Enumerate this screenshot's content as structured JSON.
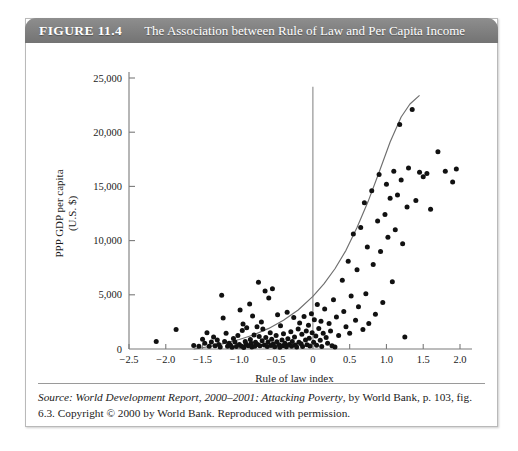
{
  "figure": {
    "number_label": "FIGURE 11.4",
    "caption": "The Association between Rule of Law and Per Capita Income",
    "source_prefix": "Source: ",
    "source_italic_1": "World Development Report, 2000–2001: Attacking Poverty",
    "source_rest": ", by World Bank, p. 103, fig. 6.3. Copyright © 2000 by World Bank. Reproduced with permission."
  },
  "colors": {
    "header_bar": "#7d7d7d",
    "header_text": "#ffffff",
    "axis": "#7a7a7a",
    "point": "#111111",
    "curve": "#6e6e6e",
    "reference_line": "#8a8a8a",
    "box_border": "#b9b9b9"
  },
  "chart_data": {
    "type": "scatter",
    "title": "The Association between Rule of Law and Per Capita Income",
    "xlabel": "Rule of law index",
    "ylabel": "PPP GDP per capita\n(U.S. $)",
    "ylabel_line1": "PPP GDP per capita",
    "ylabel_line2": "(U.S. $)",
    "xlim": [
      -2.5,
      2.0
    ],
    "ylim": [
      0,
      25000
    ],
    "xticks": [
      -2.5,
      -2.0,
      -1.5,
      -1.0,
      -0.5,
      0,
      0.5,
      1.0,
      1.5,
      2.0
    ],
    "xticklabels": [
      "−2.5",
      "−2.0",
      "−1.5",
      "−1.0",
      "−0.5",
      "0",
      "0.5",
      "1.0",
      "1.5",
      "2.0"
    ],
    "yticks": [
      0,
      5000,
      10000,
      15000,
      20000,
      25000
    ],
    "yticklabels": [
      "0",
      "5,000",
      "10,000",
      "15,000",
      "20,000",
      "25,000"
    ],
    "grid": false,
    "legend": null,
    "reference_line": {
      "type": "vertical",
      "x": 0,
      "y_from": 0,
      "y_to": 24200
    },
    "fit_curve": {
      "type": "exponential",
      "label": "fitted trend",
      "points": [
        [
          -1.62,
          0
        ],
        [
          -1.4,
          230
        ],
        [
          -1.2,
          520
        ],
        [
          -1.0,
          880
        ],
        [
          -0.8,
          1320
        ],
        [
          -0.6,
          1900
        ],
        [
          -0.4,
          2650
        ],
        [
          -0.2,
          3600
        ],
        [
          0.0,
          4850
        ],
        [
          0.15,
          6000
        ],
        [
          0.3,
          7400
        ],
        [
          0.45,
          9100
        ],
        [
          0.6,
          11200
        ],
        [
          0.75,
          13600
        ],
        [
          0.9,
          16300
        ],
        [
          1.05,
          19100
        ],
        [
          1.2,
          21400
        ],
        [
          1.32,
          22600
        ],
        [
          1.45,
          23400
        ]
      ]
    },
    "points": [
      [
        -2.13,
        700
      ],
      [
        -1.86,
        1800
      ],
      [
        -1.62,
        320
      ],
      [
        -1.55,
        250
      ],
      [
        -1.5,
        900
      ],
      [
        -1.47,
        520
      ],
      [
        -1.44,
        1500
      ],
      [
        -1.41,
        260
      ],
      [
        -1.38,
        640
      ],
      [
        -1.35,
        1100
      ],
      [
        -1.33,
        300
      ],
      [
        -1.3,
        820
      ],
      [
        -1.28,
        420
      ],
      [
        -1.26,
        180
      ],
      [
        -1.24,
        4950
      ],
      [
        -1.22,
        2850
      ],
      [
        -1.2,
        700
      ],
      [
        -1.18,
        1450
      ],
      [
        -1.16,
        260
      ],
      [
        -1.14,
        520
      ],
      [
        -1.12,
        340
      ],
      [
        -1.1,
        150
      ],
      [
        -1.08,
        980
      ],
      [
        -1.06,
        640
      ],
      [
        -1.04,
        230
      ],
      [
        -1.02,
        1250
      ],
      [
        -1.0,
        410
      ],
      [
        -0.99,
        3600
      ],
      [
        -0.97,
        260
      ],
      [
        -0.96,
        1700
      ],
      [
        -0.95,
        2300
      ],
      [
        -0.94,
        140
      ],
      [
        -0.92,
        700
      ],
      [
        -0.91,
        460
      ],
      [
        -0.9,
        1950
      ],
      [
        -0.88,
        300
      ],
      [
        -0.86,
        4150
      ],
      [
        -0.85,
        880
      ],
      [
        -0.84,
        520
      ],
      [
        -0.83,
        180
      ],
      [
        -0.82,
        3050
      ],
      [
        -0.8,
        1300
      ],
      [
        -0.79,
        250
      ],
      [
        -0.78,
        620
      ],
      [
        -0.76,
        2050
      ],
      [
        -0.75,
        420
      ],
      [
        -0.74,
        6150
      ],
      [
        -0.73,
        1150
      ],
      [
        -0.72,
        310
      ],
      [
        -0.7,
        2500
      ],
      [
        -0.69,
        750
      ],
      [
        -0.68,
        1850
      ],
      [
        -0.66,
        380
      ],
      [
        -0.65,
        5350
      ],
      [
        -0.64,
        1050
      ],
      [
        -0.62,
        230
      ],
      [
        -0.61,
        640
      ],
      [
        -0.6,
        4700
      ],
      [
        -0.58,
        1500
      ],
      [
        -0.57,
        320
      ],
      [
        -0.56,
        900
      ],
      [
        -0.55,
        5550
      ],
      [
        -0.54,
        450
      ],
      [
        -0.52,
        210
      ],
      [
        -0.5,
        1250
      ],
      [
        -0.49,
        680
      ],
      [
        -0.48,
        3150
      ],
      [
        -0.46,
        390
      ],
      [
        -0.45,
        170
      ],
      [
        -0.44,
        2150
      ],
      [
        -0.42,
        820
      ],
      [
        -0.41,
        300
      ],
      [
        -0.4,
        1400
      ],
      [
        -0.38,
        540
      ],
      [
        -0.36,
        200
      ],
      [
        -0.35,
        3400
      ],
      [
        -0.34,
        950
      ],
      [
        -0.32,
        420
      ],
      [
        -0.3,
        1600
      ],
      [
        -0.29,
        260
      ],
      [
        -0.28,
        700
      ],
      [
        -0.26,
        2900
      ],
      [
        -0.25,
        1100
      ],
      [
        -0.24,
        360
      ],
      [
        -0.22,
        190
      ],
      [
        -0.2,
        1850
      ],
      [
        -0.19,
        620
      ],
      [
        -0.18,
        2400
      ],
      [
        -0.16,
        480
      ],
      [
        -0.15,
        1350
      ],
      [
        -0.14,
        230
      ],
      [
        -0.12,
        3000
      ],
      [
        -0.1,
        840
      ],
      [
        -0.09,
        1650
      ],
      [
        -0.08,
        400
      ],
      [
        -0.06,
        2200
      ],
      [
        -0.05,
        1000
      ],
      [
        -0.04,
        280
      ],
      [
        -0.02,
        3250
      ],
      [
        -0.01,
        1500
      ],
      [
        0.01,
        620
      ],
      [
        0.02,
        2700
      ],
      [
        0.04,
        1200
      ],
      [
        0.05,
        350
      ],
      [
        0.06,
        4100
      ],
      [
        0.08,
        1900
      ],
      [
        0.1,
        800
      ],
      [
        0.11,
        2550
      ],
      [
        0.12,
        230
      ],
      [
        0.14,
        1450
      ],
      [
        0.16,
        3700
      ],
      [
        0.18,
        1050
      ],
      [
        0.2,
        520
      ],
      [
        0.22,
        2350
      ],
      [
        0.24,
        1650
      ],
      [
        0.26,
        300
      ],
      [
        0.28,
        4550
      ],
      [
        0.3,
        190
      ],
      [
        0.32,
        2950
      ],
      [
        0.35,
        1250
      ],
      [
        0.4,
        6350
      ],
      [
        0.42,
        3450
      ],
      [
        0.45,
        2050
      ],
      [
        0.48,
        8100
      ],
      [
        0.5,
        1450
      ],
      [
        0.52,
        4900
      ],
      [
        0.55,
        10600
      ],
      [
        0.58,
        2650
      ],
      [
        0.6,
        7300
      ],
      [
        0.62,
        3900
      ],
      [
        0.65,
        11200
      ],
      [
        0.68,
        1800
      ],
      [
        0.7,
        13500
      ],
      [
        0.72,
        5100
      ],
      [
        0.74,
        9400
      ],
      [
        0.76,
        2350
      ],
      [
        0.8,
        14600
      ],
      [
        0.82,
        7800
      ],
      [
        0.85,
        3200
      ],
      [
        0.88,
        11800
      ],
      [
        0.9,
        16100
      ],
      [
        0.92,
        9000
      ],
      [
        0.95,
        4300
      ],
      [
        0.98,
        12400
      ],
      [
        1.0,
        15200
      ],
      [
        1.02,
        10300
      ],
      [
        1.05,
        13900
      ],
      [
        1.08,
        6200
      ],
      [
        1.1,
        16400
      ],
      [
        1.12,
        11000
      ],
      [
        1.15,
        14200
      ],
      [
        1.18,
        20700
      ],
      [
        1.2,
        15600
      ],
      [
        1.22,
        9700
      ],
      [
        1.25,
        1100
      ],
      [
        1.28,
        13100
      ],
      [
        1.3,
        16700
      ],
      [
        1.35,
        22100
      ],
      [
        1.4,
        13700
      ],
      [
        1.45,
        16300
      ],
      [
        1.5,
        15900
      ],
      [
        1.55,
        16200
      ],
      [
        1.6,
        12900
      ],
      [
        1.7,
        18200
      ],
      [
        1.8,
        16400
      ],
      [
        1.9,
        15400
      ],
      [
        1.95,
        16600
      ]
    ]
  }
}
